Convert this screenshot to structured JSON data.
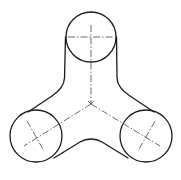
{
  "diagram": {
    "type": "engineering-drawing",
    "colors": {
      "background": "#ffffff",
      "stroke": "#1a1a1a"
    },
    "center_junction": {
      "x": 91,
      "y": 104
    },
    "lobes": [
      {
        "id": "top",
        "cx": 91,
        "cy": 37,
        "r": 25
      },
      {
        "id": "bottom-left",
        "cx": 36,
        "cy": 136,
        "r": 26
      },
      {
        "id": "bottom-right",
        "cx": 146,
        "cy": 136,
        "r": 26
      }
    ],
    "labels": []
  }
}
